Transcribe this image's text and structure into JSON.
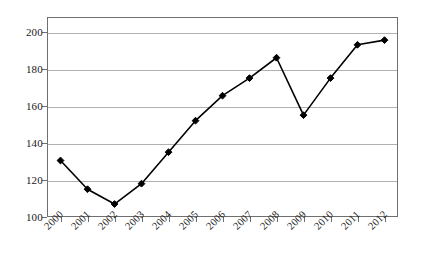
{
  "chart_data": {
    "type": "line",
    "title": "",
    "subtitle": "",
    "xlabel": "",
    "ylabel": "",
    "categories": [
      "2000",
      "2001",
      "2002",
      "2003",
      "2004",
      "2005",
      "2006",
      "2007",
      "2008",
      "2009",
      "2010",
      "2011",
      "2012"
    ],
    "series": [
      {
        "name": "",
        "values": [
          130.5,
          115,
          107,
          118,
          135,
          152,
          165.5,
          175,
          186,
          155,
          175,
          193,
          195.5
        ]
      }
    ],
    "ylim": [
      100,
      208
    ],
    "yticks": [
      100,
      120,
      140,
      160,
      180,
      200
    ],
    "ytick_labels": [
      "100",
      "120",
      "140",
      "160",
      "180",
      "200"
    ],
    "xtick_labels": [
      "2000",
      "2001",
      "2002",
      "2003",
      "2004",
      "2005",
      "2006",
      "2007",
      "2008",
      "2009",
      "2010",
      "2011",
      "2012"
    ],
    "grid": "horizontal",
    "legend": "none",
    "marker": "diamond",
    "line_color": "#000000",
    "marker_color": "#000000",
    "grid_color": "#b0b0b0",
    "axis_color": "#6f6f6f",
    "background_color": "#ffffff",
    "xtick_label_rotation": -45
  }
}
